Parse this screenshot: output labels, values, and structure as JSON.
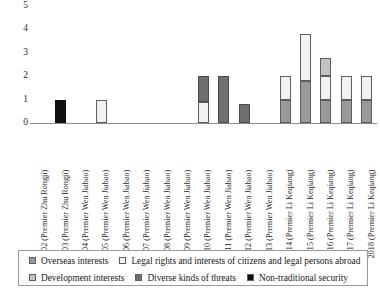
{
  "chart_data": {
    "type": "bar",
    "stacked": true,
    "title": "",
    "subtitle": "",
    "xlabel": "",
    "ylabel": "",
    "ylim": [
      0,
      5
    ],
    "yticks": [
      0,
      1,
      2,
      3,
      4,
      5
    ],
    "ytick_labels": [
      "0",
      "1",
      "2",
      "3",
      "4",
      "5"
    ],
    "grid": false,
    "legend_position": "bottom",
    "categories": [
      "2002 (Premier Zhu Rongji)",
      "2003 (Premier Zhu Rongji)",
      "2004 (Premier Wen Jiabao)",
      "2005 (Premier Wen Jiabao)",
      "2006 (Premier Wen Jiabao)",
      "2007 (Premier Wen Jiabao)",
      "2008 (Premier Wen Jiabao)",
      "2009 (Premier Wen Jiabao)",
      "2010 (Premier Wen Jiabao)",
      "2011 (Premier Wen Jiabao)",
      "2012 (Premier Wen Jiabao)",
      "2013 (Premier Wen Jiabao)",
      "2014 (Premier Li Keqiang)",
      "2015 (Premier Li Keqiang)",
      "2016 (Premier Li Keqiang)",
      "2017 (Premier Li Keqiang)",
      "2018 (Premier Li Keqiang)"
    ],
    "series": [
      {
        "name": "Overseas interests",
        "color": "#9a9a9a",
        "values": [
          0,
          0,
          0,
          0,
          0,
          0,
          0,
          0,
          0,
          0,
          0,
          0,
          1,
          1.8,
          1,
          1,
          1
        ]
      },
      {
        "name": "Legal rights and interests of citizens and legal persons abroad",
        "color": "#f2f2f2",
        "values": [
          0,
          0,
          0,
          1,
          0,
          0,
          0,
          0,
          0.9,
          0,
          0,
          0,
          1,
          2,
          1,
          1,
          1
        ]
      },
      {
        "name": "Development interests",
        "color": "#c3c3c3",
        "values": [
          0,
          0,
          0,
          0,
          0,
          0,
          0,
          0,
          0,
          0,
          0,
          0,
          0,
          0,
          0.8,
          0,
          0
        ]
      },
      {
        "name": "Diverse kinds of threats",
        "color": "#6f6f6f",
        "values": [
          0,
          0,
          0,
          0,
          0,
          0,
          0,
          0,
          1.1,
          2,
          0.8,
          0,
          0,
          0,
          0,
          0,
          0
        ]
      },
      {
        "name": "Non-traditional security",
        "color": "#111111",
        "values": [
          0,
          1,
          0,
          0,
          0,
          0,
          0,
          0,
          0,
          0,
          0,
          0,
          0,
          0,
          0,
          0,
          0
        ]
      }
    ],
    "bar_totals": [
      0,
      1,
      0,
      1,
      0,
      0,
      0,
      0,
      2,
      2,
      0.8,
      0,
      2,
      3.8,
      2.8,
      2,
      2
    ]
  },
  "legend": {
    "items": [
      {
        "label": "Overseas interests",
        "swatch": "#9a9a9a",
        "row": 1
      },
      {
        "label": "Legal rights and interests of citizens and legal persons abroad",
        "swatch": "#f2f2f2",
        "row": 1
      },
      {
        "label": "Development interests",
        "swatch": "#c3c3c3",
        "row": 2
      },
      {
        "label": "Diverse kinds of threats",
        "swatch": "#6f6f6f",
        "row": 2
      },
      {
        "label": "Non-traditional security",
        "swatch": "#111111",
        "row": 2
      }
    ]
  }
}
